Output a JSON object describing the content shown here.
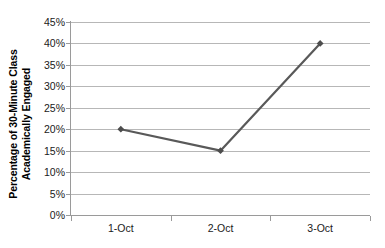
{
  "chart_data": {
    "type": "line",
    "title": "",
    "xlabel": "",
    "ylabel": "Percentage of 30-Minute Class Academically Engaged",
    "ylabel_lines": [
      "Percentage of 30-Minute Class",
      "Academically Engaged"
    ],
    "categories": [
      "1-Oct",
      "2-Oct",
      "3-Oct"
    ],
    "values": [
      20,
      15,
      40
    ],
    "series": [
      {
        "name": "Percentage of 30-Minute Class Academically Engaged",
        "values": [
          20,
          15,
          40
        ]
      }
    ],
    "ylim": [
      0,
      45
    ],
    "ytick_step": 5,
    "ytick_labels": [
      "45%",
      "40%",
      "35%",
      "30%",
      "25%",
      "20%",
      "15%",
      "10%",
      "5%",
      "0%"
    ],
    "ytick_values": [
      45,
      40,
      35,
      30,
      25,
      20,
      15,
      10,
      5,
      0
    ],
    "grid": true,
    "grid_axis": "y",
    "legend": false,
    "legend_position": "none",
    "marker": "diamond",
    "colors": {
      "series_line": "#595959",
      "marker": "#4d4d4d",
      "gridline": "#b7b7b7",
      "axis": "#9a9a9a",
      "text": "#1a1a1a",
      "background": "#ffffff"
    }
  }
}
